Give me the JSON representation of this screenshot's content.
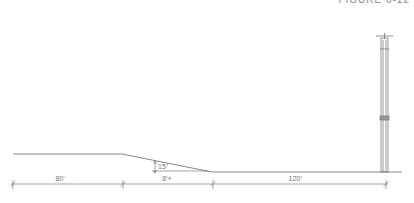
{
  "figure": {
    "caption": "FIGURE 6-12"
  },
  "drawing": {
    "line_color": "#6a6a6a",
    "ground": {
      "upper_level_y": 154,
      "lower_level_y": 172
    },
    "slope": {
      "angle_label": "15°"
    },
    "dimensions": [
      {
        "label": "80'",
        "from_x": 13,
        "to_x": 123
      },
      {
        "label": "8'+",
        "from_x": 123,
        "to_x": 213
      },
      {
        "label": "120'",
        "from_x": 213,
        "to_x": 386
      }
    ],
    "pole": {
      "name": "light pole",
      "x_left": 381,
      "x_right": 388,
      "top_y": 38,
      "bottom_y": 172
    }
  }
}
